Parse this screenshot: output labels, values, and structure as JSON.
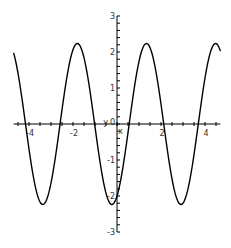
{
  "chart_data": {
    "type": "line",
    "title": "",
    "xlabel": "x",
    "ylabel": "y",
    "xlim": [
      -4.7,
      4.7
    ],
    "ylim": [
      -3,
      3
    ],
    "grid": false,
    "legend": null,
    "x_ticks": [
      -4,
      -2,
      0,
      2,
      4
    ],
    "x_tick_labels": [
      "-4",
      "-2",
      "0",
      "2",
      "4"
    ],
    "y_ticks": [
      -3,
      -2,
      -1,
      0,
      1,
      2,
      3
    ],
    "y_tick_labels": [
      "-3",
      "-2",
      "-1",
      "0",
      "1",
      "2",
      "3"
    ],
    "series": [
      {
        "name": "f(x)",
        "expression_estimate": "sin(2x) - 2cos(2x)",
        "color": "#000000",
        "x": [
          -4.7,
          -4.2,
          -3.7,
          -3.3,
          -2.9,
          -2.5,
          -2.1,
          -1.8,
          -1.3,
          -0.9,
          -0.5,
          -0.2,
          0.2,
          0.6,
          1.0,
          1.35,
          1.7,
          2.1,
          2.5,
          2.9,
          3.3,
          3.7,
          4.1,
          4.5,
          4.7
        ],
        "y": [
          2.0,
          0.5,
          -1.6,
          -2.23,
          -1.6,
          0.0,
          1.6,
          2.2,
          1.4,
          -0.3,
          -1.9,
          -2.2,
          -1.4,
          0.3,
          1.8,
          2.24,
          1.5,
          -0.1,
          -1.8,
          -2.2,
          -1.3,
          0.4,
          1.9,
          2.2,
          2.0
        ]
      }
    ]
  }
}
